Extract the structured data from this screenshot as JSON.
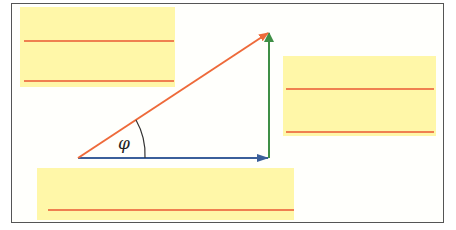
{
  "diagram": {
    "type": "vector-triangle",
    "angle_label": "φ",
    "colors": {
      "hypotenuse": "#ee6a3a",
      "horizontal": "#3b5f9a",
      "vertical": "#3f8f46",
      "box_fill": "#fff7a8",
      "box_lines": "#ef8050",
      "frame": "#555555"
    },
    "vectors": [
      {
        "name": "hypotenuse",
        "from": [
          78,
          158
        ],
        "to": [
          269,
          32
        ]
      },
      {
        "name": "horizontal",
        "from": [
          78,
          158
        ],
        "to": [
          269,
          158
        ]
      },
      {
        "name": "vertical",
        "from": [
          269,
          158
        ],
        "to": [
          269,
          32
        ]
      }
    ],
    "answer_boxes": [
      {
        "name": "top-left",
        "x": 20,
        "y": 7,
        "w": 155,
        "h": 80,
        "lines": [
          41,
          81
        ]
      },
      {
        "name": "right",
        "x": 283,
        "y": 56,
        "w": 153,
        "h": 80,
        "lines": [
          89,
          131
        ]
      },
      {
        "name": "bottom",
        "x": 37,
        "y": 168,
        "w": 257,
        "h": 52,
        "lines": [
          210
        ]
      }
    ]
  }
}
